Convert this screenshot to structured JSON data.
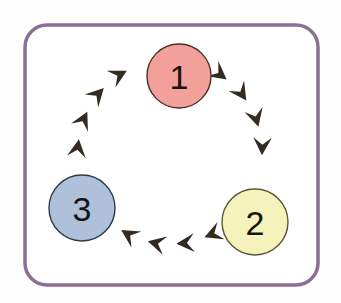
{
  "diagram": {
    "type": "cycle",
    "title": "",
    "frame": {
      "stroke_color": "#8c6e96",
      "fill_color": "#ffffff",
      "stroke_width": 3.5,
      "corner_radius": 22,
      "x": 25,
      "y": 25,
      "width": 293,
      "height": 260
    },
    "direction": "clockwise",
    "nodes": [
      {
        "id": "node-1",
        "label": "1",
        "fill_color": "#f2a09a",
        "stroke_color": "#4a2f2a",
        "cx": 179,
        "cy": 76,
        "r": 32,
        "position": "top"
      },
      {
        "id": "node-2",
        "label": "2",
        "fill_color": "#f5f2bc",
        "stroke_color": "#5a5535",
        "cx": 255,
        "cy": 222,
        "r": 33,
        "position": "bottom-right"
      },
      {
        "id": "node-3",
        "label": "3",
        "fill_color": "#afc1da",
        "stroke_color": "#2f3a48",
        "cx": 82,
        "cy": 208,
        "r": 33,
        "position": "bottom-left"
      }
    ],
    "arrows": {
      "color": "#332a20",
      "count": 12,
      "per_segment": 4,
      "ring_cx": 170,
      "ring_cy": 152,
      "ring_r": 92,
      "size": 17,
      "angles_deg": [
        -52,
        -34,
        -16,
        2,
        20,
        56,
        74,
        92,
        110,
        128,
        164,
        182,
        200,
        218,
        236,
        272,
        290,
        308
      ]
    },
    "segments": [
      {
        "from": "node-1",
        "to": "node-2",
        "side": "right",
        "arrow_angles_deg": [
          -52,
          -34,
          -16,
          2
        ]
      },
      {
        "from": "node-2",
        "to": "node-3",
        "side": "bottom",
        "arrow_angles_deg": [
          68,
          86,
          104,
          122
        ]
      },
      {
        "from": "node-3",
        "to": "node-1",
        "side": "left",
        "arrow_angles_deg": [
          188,
          206,
          224,
          242
        ]
      }
    ]
  }
}
